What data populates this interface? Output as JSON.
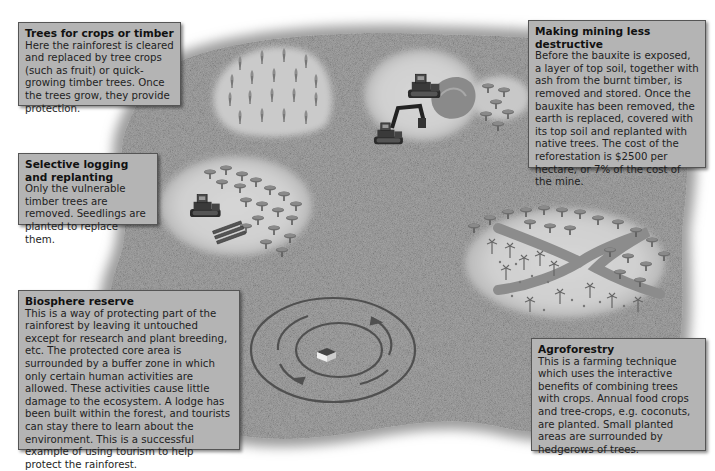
{
  "diagram": {
    "colors": {
      "forest_texture": "#9a9a9a",
      "clearing": "#d0d0d0",
      "box_fill": "#b4b4b4",
      "box_border": "#555555",
      "text": "#1e1e1e"
    },
    "boxes": [
      {
        "id": "trees-for-crops",
        "title": "Trees for crops or timber",
        "body": "Here the rainforest is cleared and replaced by tree crops (such as fruit) or quick-growing timber trees. Once the trees grow, they provide protection."
      },
      {
        "id": "mining",
        "title": "Making mining less destructive",
        "body": "Before the bauxite is exposed, a layer of top soil, together with ash from the burnt timber, is removed and stored. Once the bauxite has been removed, the earth is replaced, covered with its top soil and replanted with native trees. The cost of the reforestation is $2500 per hectare, or 7% of the cost of the mine."
      },
      {
        "id": "selective-logging",
        "title": "Selective logging and replanting",
        "body": "Only the vulnerable timber trees are removed. Seedlings are planted to replace them."
      },
      {
        "id": "biosphere-reserve",
        "title": "Biosphere reserve",
        "body": "This is a way of protecting part of the rainforest by leaving it untouched except for research and plant breeding, etc. The protected core area is surrounded by a buffer zone in which only certain human activities are allowed. These activities cause little damage to the ecosystem. A lodge has been built within the forest, and tourists can stay there to learn about the environment. This is a successful example of using tourism to help protect the rainforest."
      },
      {
        "id": "agroforestry",
        "title": "Agroforestry",
        "body": "This is a farming technique which uses the interactive benefits of combining trees with crops. Annual food crops and tree-crops, e.g. coconuts, are planted. Small planted areas are surrounded by hedgerows of trees."
      }
    ],
    "illustrations": [
      {
        "name": "tree-plantation",
        "depicts": "clearing with rows of young timber trees"
      },
      {
        "name": "mining-site",
        "depicts": "bulldozer, excavator, soil heap and replanted trees"
      },
      {
        "name": "selective-logging-site",
        "depicts": "bulldozer with logs among trees"
      },
      {
        "name": "biosphere-reserve-rings",
        "depicts": "concentric rings with arrows around a lodge"
      },
      {
        "name": "agroforestry-plot",
        "depicts": "forked track with hedgerow trees and crops"
      }
    ]
  }
}
